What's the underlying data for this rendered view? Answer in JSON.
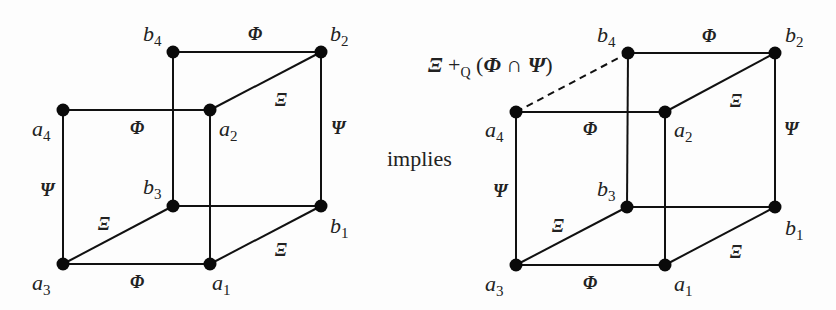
{
  "connector_text": "implies",
  "left_cube": {
    "nodes": {
      "a1": {
        "x": 210,
        "y": 264,
        "name": "a",
        "sub": "1",
        "lx": 212,
        "ly": 290
      },
      "a2": {
        "x": 210,
        "y": 110,
        "name": "a",
        "sub": "2",
        "lx": 219,
        "ly": 136
      },
      "a3": {
        "x": 63,
        "y": 264,
        "name": "a",
        "sub": "3",
        "lx": 32,
        "ly": 290
      },
      "a4": {
        "x": 63,
        "y": 110,
        "name": "a",
        "sub": "4",
        "lx": 32,
        "ly": 136
      },
      "b1": {
        "x": 321,
        "y": 206,
        "name": "b",
        "sub": "1",
        "lx": 330,
        "ly": 233
      },
      "b2": {
        "x": 321,
        "y": 52,
        "name": "b",
        "sub": "2",
        "lx": 330,
        "ly": 41
      },
      "b3": {
        "x": 173,
        "y": 206,
        "name": "b",
        "sub": "3",
        "lx": 143,
        "ly": 194
      },
      "b4": {
        "x": 173,
        "y": 52,
        "name": "b",
        "sub": "4",
        "lx": 143,
        "ly": 41
      }
    },
    "edges": [
      {
        "from": "b4",
        "to": "b2",
        "label": "Φ",
        "lx": 248,
        "ly": 40
      },
      {
        "from": "a4",
        "to": "a2",
        "label": "Φ",
        "lx": 130,
        "ly": 134
      },
      {
        "from": "a3",
        "to": "a1",
        "label": "Φ",
        "lx": 130,
        "ly": 288
      },
      {
        "from": "b3",
        "to": "b1",
        "label": "",
        "lx": 0,
        "ly": 0
      },
      {
        "from": "a4",
        "to": "a3",
        "label": "Ψ",
        "lx": 40,
        "ly": 196
      },
      {
        "from": "b2",
        "to": "b1",
        "label": "Ψ",
        "lx": 331,
        "ly": 134
      },
      {
        "from": "b4",
        "to": "b3",
        "label": "",
        "lx": 0,
        "ly": 0
      },
      {
        "from": "a2",
        "to": "a1",
        "label": "",
        "lx": 0,
        "ly": 0
      },
      {
        "from": "a2",
        "to": "b2",
        "label": "Ξ",
        "lx": 275,
        "ly": 106
      },
      {
        "from": "a3",
        "to": "b3",
        "label": "Ξ",
        "lx": 98,
        "ly": 230
      },
      {
        "from": "a1",
        "to": "b1",
        "label": "Ξ",
        "lx": 275,
        "ly": 256
      }
    ]
  },
  "right_cube": {
    "nodes": {
      "a1": {
        "x": 665,
        "y": 265,
        "name": "a",
        "sub": "1",
        "lx": 674,
        "ly": 291
      },
      "a2": {
        "x": 665,
        "y": 112,
        "name": "a",
        "sub": "2",
        "lx": 674,
        "ly": 137
      },
      "a3": {
        "x": 516,
        "y": 265,
        "name": "a",
        "sub": "3",
        "lx": 485,
        "ly": 291
      },
      "a4": {
        "x": 516,
        "y": 112,
        "name": "a",
        "sub": "4",
        "lx": 485,
        "ly": 137
      },
      "b1": {
        "x": 775,
        "y": 207,
        "name": "b",
        "sub": "1",
        "lx": 785,
        "ly": 235
      },
      "b2": {
        "x": 775,
        "y": 53,
        "name": "b",
        "sub": "2",
        "lx": 785,
        "ly": 42
      },
      "b3": {
        "x": 627,
        "y": 207,
        "name": "b",
        "sub": "3",
        "lx": 597,
        "ly": 196
      },
      "b4": {
        "x": 628,
        "y": 53,
        "name": "b",
        "sub": "4",
        "lx": 597,
        "ly": 42
      }
    },
    "edges": [
      {
        "from": "b4",
        "to": "b2",
        "label": "Φ",
        "lx": 702,
        "ly": 42
      },
      {
        "from": "a4",
        "to": "a2",
        "label": "Φ",
        "lx": 583,
        "ly": 135
      },
      {
        "from": "a3",
        "to": "a1",
        "label": "Φ",
        "lx": 583,
        "ly": 289
      },
      {
        "from": "b3",
        "to": "b1",
        "label": "",
        "lx": 0,
        "ly": 0
      },
      {
        "from": "a4",
        "to": "a3",
        "label": "Ψ",
        "lx": 493,
        "ly": 197
      },
      {
        "from": "b2",
        "to": "b1",
        "label": "Ψ",
        "lx": 784,
        "ly": 135
      },
      {
        "from": "b4",
        "to": "b3",
        "label": "",
        "lx": 0,
        "ly": 0
      },
      {
        "from": "a2",
        "to": "a1",
        "label": "",
        "lx": 0,
        "ly": 0
      },
      {
        "from": "a2",
        "to": "b2",
        "label": "Ξ",
        "lx": 730,
        "ly": 107
      },
      {
        "from": "a3",
        "to": "b3",
        "label": "Ξ",
        "lx": 552,
        "ly": 232
      },
      {
        "from": "a1",
        "to": "b1",
        "label": "Ξ",
        "lx": 730,
        "ly": 258
      }
    ],
    "dashed_edge": {
      "from": "a4",
      "to": "b4"
    },
    "dashed_label": {
      "x": 428,
      "y": 72,
      "xi": "Ξ",
      "plus": " +",
      "sub": "Q",
      "open": " (",
      "phi": "Φ",
      "cap": " ∩ ",
      "psi": "Ψ",
      "close": ")"
    }
  }
}
